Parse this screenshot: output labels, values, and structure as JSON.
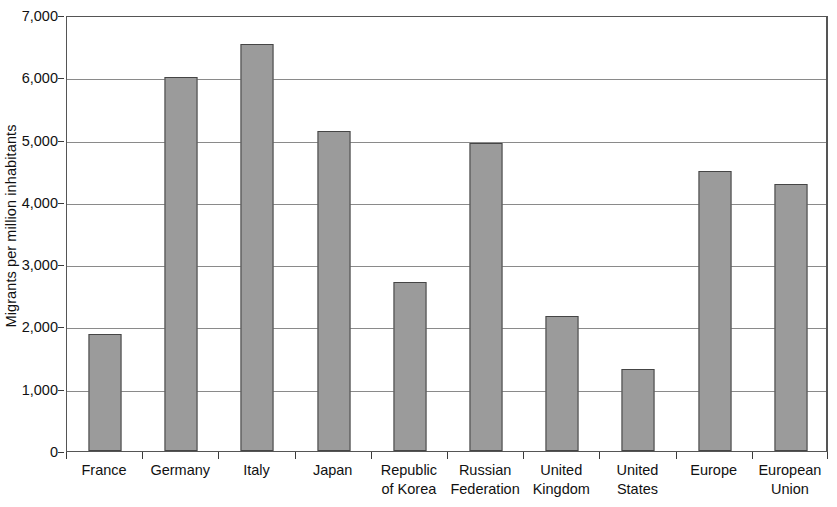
{
  "chart_data": {
    "type": "bar",
    "title": "",
    "xlabel": "",
    "ylabel": "Migrants per million inhabitants",
    "ylim": [
      0,
      7000
    ],
    "ytick_values": [
      0,
      1000,
      2000,
      3000,
      4000,
      5000,
      6000,
      7000
    ],
    "ytick_labels": [
      "0",
      "1,000",
      "2,000",
      "3,000",
      "4,000",
      "5,000",
      "6,000",
      "7,000"
    ],
    "grid": true,
    "legend": "none",
    "bar_color": "#9b9b9b",
    "bar_border_color": "#454545",
    "categories": [
      "France",
      "Germany",
      "Italy",
      "Japan",
      "Republic of Korea",
      "Russian Federation",
      "United Kingdom",
      "United States",
      "Europe",
      "European Union"
    ],
    "category_label_lines": [
      [
        "France",
        ""
      ],
      [
        "Germany",
        ""
      ],
      [
        "Italy",
        ""
      ],
      [
        "Japan",
        ""
      ],
      [
        "Republic",
        "of Korea"
      ],
      [
        "Russian",
        "Federation"
      ],
      [
        "United",
        "Kingdom"
      ],
      [
        "United",
        "States"
      ],
      [
        "Europe",
        ""
      ],
      [
        "European",
        "Union"
      ]
    ],
    "values": [
      1880,
      6000,
      6530,
      5140,
      2720,
      4950,
      2160,
      1310,
      4490,
      4280
    ]
  }
}
